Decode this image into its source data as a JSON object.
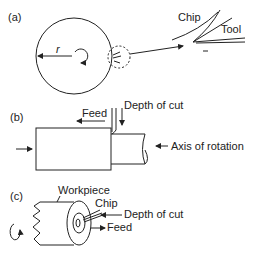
{
  "panels": {
    "a": {
      "label": "(a)",
      "radius_label": "r",
      "chip_label": "Chip",
      "tool_label": "Tool"
    },
    "b": {
      "label": "(b)",
      "feed_label": "Feed",
      "depth_label": "Depth of cut",
      "axis_label": "Axis of rotation"
    },
    "c": {
      "label": "(c)",
      "workpiece_label": "Workpiece",
      "chip_label": "Chip",
      "depth_label": "Depth of cut",
      "feed_label": "Feed"
    }
  }
}
